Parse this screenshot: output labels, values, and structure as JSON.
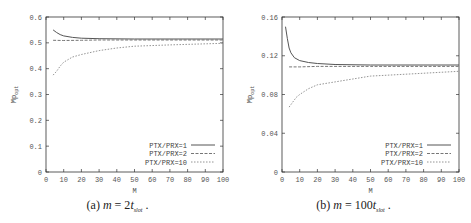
{
  "chart_data": [
    {
      "type": "line",
      "title": "",
      "caption": {
        "prefix": "(a) ",
        "var": "m",
        "eq": " = 2",
        "t": "t",
        "sub": "slot",
        "suffix": " ."
      },
      "xlabel": "M",
      "ylabel": "Mp_opt",
      "xlim": [
        0,
        100
      ],
      "ylim": [
        0,
        0.6
      ],
      "xticks": [
        "0",
        "10",
        "20",
        "30",
        "40",
        "50",
        "60",
        "70",
        "80",
        "90",
        "100"
      ],
      "yticks": [
        "0",
        "0.1",
        "0.2",
        "0.3",
        "0.4",
        "0.5",
        "0.6"
      ],
      "legend_position": "lower right",
      "series": [
        {
          "name": "PTX/PRX=1",
          "style": "solid",
          "x": [
            4,
            6,
            8,
            10,
            15,
            20,
            30,
            50,
            100
          ],
          "y": [
            0.55,
            0.54,
            0.532,
            0.527,
            0.521,
            0.518,
            0.516,
            0.515,
            0.515
          ]
        },
        {
          "name": "PTX/PRX=2",
          "style": "dashed",
          "x": [
            4,
            10,
            20,
            30,
            50,
            100
          ],
          "y": [
            0.51,
            0.509,
            0.51,
            0.511,
            0.511,
            0.511
          ]
        },
        {
          "name": "PTX/PRX=10",
          "style": "dotted",
          "x": [
            4,
            6,
            8,
            10,
            15,
            20,
            30,
            40,
            50,
            70,
            100
          ],
          "y": [
            0.375,
            0.39,
            0.41,
            0.425,
            0.445,
            0.455,
            0.47,
            0.48,
            0.487,
            0.492,
            0.498
          ]
        }
      ]
    },
    {
      "type": "line",
      "title": "",
      "caption": {
        "prefix": "(b) ",
        "var": "m",
        "eq": " = 100",
        "t": "t",
        "sub": "slot",
        "suffix": " ."
      },
      "xlabel": "M",
      "ylabel": "Mp_opt",
      "xlim": [
        0,
        100
      ],
      "ylim": [
        0,
        0.16
      ],
      "xticks": [
        "0",
        "10",
        "20",
        "30",
        "40",
        "50",
        "60",
        "70",
        "80",
        "90",
        "100"
      ],
      "yticks": [
        "0",
        "0.04",
        "0.08",
        "0.12",
        "0.16"
      ],
      "legend_position": "lower right",
      "series": [
        {
          "name": "PTX/PRX=1",
          "style": "solid",
          "x": [
            2,
            3,
            4,
            5,
            7,
            10,
            15,
            20,
            30,
            50,
            100
          ],
          "y": [
            0.15,
            0.138,
            0.128,
            0.123,
            0.118,
            0.115,
            0.113,
            0.112,
            0.111,
            0.1105,
            0.1105
          ]
        },
        {
          "name": "PTX/PRX=2",
          "style": "dashed",
          "x": [
            4,
            10,
            20,
            50,
            100
          ],
          "y": [
            0.1085,
            0.1085,
            0.109,
            0.109,
            0.109
          ]
        },
        {
          "name": "PTX/PRX=10",
          "style": "dotted",
          "x": [
            4,
            6,
            8,
            10,
            15,
            20,
            30,
            40,
            50,
            70,
            100
          ],
          "y": [
            0.067,
            0.072,
            0.077,
            0.08,
            0.086,
            0.09,
            0.093,
            0.096,
            0.099,
            0.101,
            0.104
          ]
        }
      ]
    }
  ]
}
